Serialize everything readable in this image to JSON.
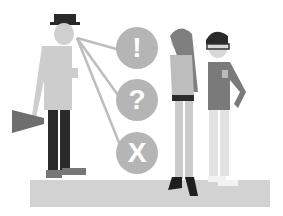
{
  "illustration": {
    "description": "Three people standing on a floor; man with megaphone and top hat with lines to three symbol bubbles",
    "bubbles": [
      {
        "symbol": "!"
      },
      {
        "symbol": "?"
      },
      {
        "symbol": "X"
      }
    ]
  },
  "colors": {
    "floor": "#d0d0d0",
    "bubble": "#b3b3b3",
    "figure_light": "#c8c8c8",
    "figure_mid": "#8c8c8c",
    "figure_dark": "#2b2b2b",
    "line": "#bdbdbd"
  }
}
